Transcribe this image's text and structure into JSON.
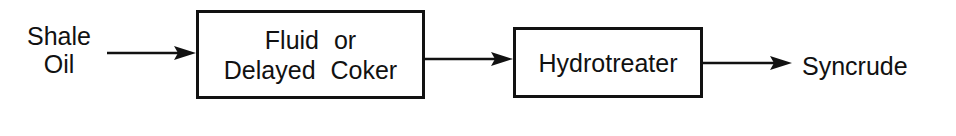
{
  "diagram": {
    "type": "process-flow",
    "input": {
      "line1": "Shale",
      "line2": "Oil"
    },
    "nodes": [
      {
        "id": "coker",
        "line1": "Fluid  or",
        "line2": "Delayed  Coker"
      },
      {
        "id": "hydrotreater",
        "label": "Hydrotreater"
      }
    ],
    "output": {
      "label": "Syncrude"
    },
    "edges": [
      {
        "from": "Shale Oil",
        "to": "Fluid or Delayed Coker"
      },
      {
        "from": "Fluid or Delayed Coker",
        "to": "Hydrotreater"
      },
      {
        "from": "Hydrotreater",
        "to": "Syncrude"
      }
    ],
    "colors": {
      "stroke": "#111111",
      "background": "#ffffff"
    }
  }
}
